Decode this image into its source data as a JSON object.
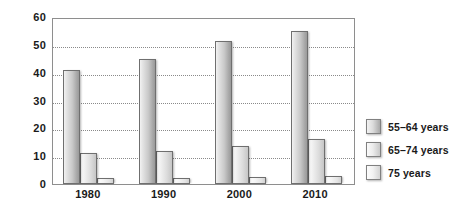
{
  "chart_data": {
    "type": "bar",
    "title": "",
    "subtitle": "",
    "xlabel": "",
    "ylabel": "",
    "categories": [
      "1980",
      "1990",
      "2000",
      "2010"
    ],
    "series": [
      {
        "name": "55–64 years",
        "values": [
          41,
          45,
          51.5,
          55
        ]
      },
      {
        "name": "65–74 years",
        "values": [
          11,
          12,
          13.5,
          16
        ]
      },
      {
        "name": "75 years",
        "values": [
          2,
          2,
          2.5,
          3
        ]
      }
    ],
    "ylim": [
      0,
      60
    ],
    "ytick_labels": [
      "60",
      "50",
      "40",
      "30",
      "20",
      "10",
      "0"
    ],
    "ytick_values": [
      60,
      50,
      40,
      30,
      20,
      10,
      0
    ],
    "gridlines": [
      50,
      40,
      30,
      20,
      10
    ],
    "grid": true,
    "grid_style": "dotted",
    "legend_position": "right",
    "legend": [
      "55–64 years",
      "65–74 years",
      "75 years"
    ],
    "colors": {
      "series_0": "#c9c9c9",
      "series_1": "#dcdcdc",
      "series_2": "#e8e8e8",
      "bar_border": "#6f6f6f",
      "axis": "#8e8e8e",
      "grid": "#8a8a8a",
      "text": "#1a1a1a",
      "background": "#ffffff"
    }
  }
}
